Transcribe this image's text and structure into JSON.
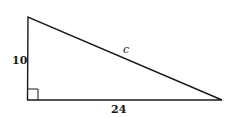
{
  "diagram": {
    "type": "right-triangle",
    "vertices": {
      "top": [
        28,
        17
      ],
      "right_angle": [
        27,
        100
      ],
      "far": [
        222,
        100
      ]
    },
    "labels": {
      "vertical_leg": "10",
      "horizontal_leg": "24",
      "hypotenuse": "c"
    },
    "right_angle_marker": true,
    "stroke_color": "#1a1a1a"
  }
}
